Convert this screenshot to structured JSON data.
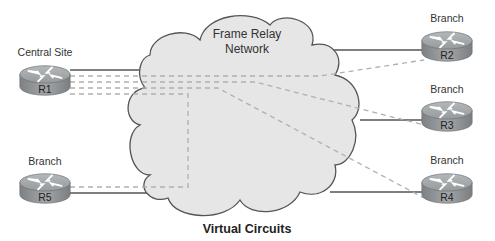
{
  "diagram": {
    "caption": "Virtual Circuits",
    "network": {
      "line1": "Frame Relay",
      "line2": "Network"
    },
    "routers": [
      {
        "id": "R1",
        "name": "R1",
        "role": "Central Site"
      },
      {
        "id": "R2",
        "name": "R2",
        "role": "Branch"
      },
      {
        "id": "R3",
        "name": "R3",
        "role": "Branch"
      },
      {
        "id": "R4",
        "name": "R4",
        "role": "Branch"
      },
      {
        "id": "R5",
        "name": "R5",
        "role": "Branch"
      }
    ],
    "colors": {
      "cloud_fill": "#e6e6e6",
      "cloud_stroke": "#555555",
      "physical_link": "#555555",
      "virtual_circuit": "#b0b0b0",
      "router_body": "#8f9396",
      "router_top": "#a6aaad"
    }
  }
}
